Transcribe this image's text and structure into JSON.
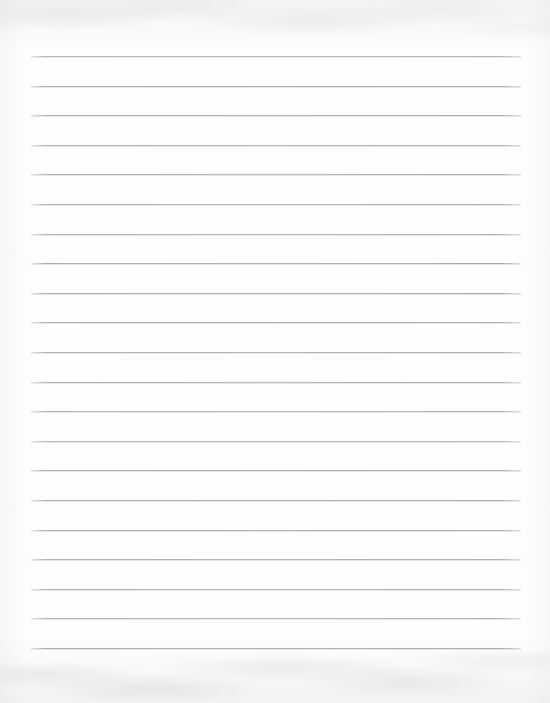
{
  "document": {
    "kind": "scanned-paper-page",
    "title": "Blank ruled notebook page",
    "content_text": "",
    "has_handwriting": false,
    "has_printed_text": false
  },
  "page": {
    "width": 550,
    "height": 703,
    "background_color": "#fdfdfd",
    "paper_tone": "off-white",
    "texture": "faint mottled scan grain along top and bottom edges"
  },
  "ruling": {
    "style": "horizontal ruled lines",
    "line_color": "#b0b4b7",
    "line_thickness": 1,
    "line_count": 21,
    "spacing": 29.6,
    "first_line_y": 56,
    "last_line_y": 648,
    "left_x": 31,
    "right_x": 521,
    "line_length": 490,
    "margin_rule": "none",
    "lines_y": [
      56,
      85.6,
      115.2,
      144.8,
      174.4,
      204,
      233.6,
      263.2,
      292.8,
      322.4,
      352,
      381.6,
      411.2,
      440.8,
      470.4,
      500,
      529.6,
      559.2,
      588.8,
      618.4,
      648
    ]
  },
  "margins": {
    "top": 56,
    "bottom": 55,
    "left": 31,
    "right": 29
  }
}
